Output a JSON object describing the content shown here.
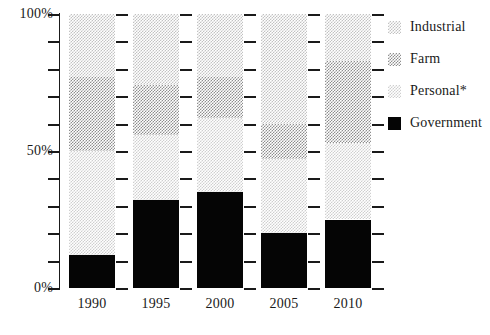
{
  "chart_data": {
    "type": "bar",
    "subtype": "stacked-bar-100-percent",
    "title": "",
    "xlabel": "",
    "ylabel": "",
    "categories": [
      "1990",
      "1995",
      "2000",
      "2005",
      "2010"
    ],
    "ylim": [
      0,
      100
    ],
    "ytick_values": [
      0,
      10,
      20,
      30,
      40,
      50,
      60,
      70,
      80,
      90,
      100
    ],
    "ytick_labels_shown": [
      "0%",
      "50%",
      "100%"
    ],
    "grid": false,
    "legend_position": "right",
    "stack_order_bottom_to_top": [
      "Government",
      "Personal*",
      "Farm",
      "Industrial"
    ],
    "series": [
      {
        "name": "Government",
        "color": "#050505",
        "values": [
          12,
          32,
          35,
          20,
          25
        ]
      },
      {
        "name": "Personal*",
        "color": "#cfcfcf",
        "values": [
          38,
          24,
          27,
          27,
          28
        ]
      },
      {
        "name": "Farm",
        "color": "#8e8e8e",
        "values": [
          27,
          18,
          15,
          13,
          30
        ]
      },
      {
        "name": "Industrial",
        "color": "#c2c2c2",
        "values": [
          23,
          26,
          23,
          40,
          17
        ]
      }
    ]
  },
  "axes": {
    "y_labels": [
      {
        "value": 100,
        "text": "100%"
      },
      {
        "value": 90,
        "text": ""
      },
      {
        "value": 80,
        "text": ""
      },
      {
        "value": 70,
        "text": ""
      },
      {
        "value": 60,
        "text": ""
      },
      {
        "value": 50,
        "text": "50%"
      },
      {
        "value": 40,
        "text": ""
      },
      {
        "value": 30,
        "text": ""
      },
      {
        "value": 20,
        "text": ""
      },
      {
        "value": 10,
        "text": ""
      },
      {
        "value": 0,
        "text": "0%"
      }
    ],
    "x_labels": [
      "1990",
      "1995",
      "2000",
      "2005",
      "2010"
    ]
  },
  "legend": {
    "items": [
      {
        "label": "Industrial",
        "swatch": "industrial-swatch",
        "color": "#c2c2c2"
      },
      {
        "label": "Farm",
        "swatch": "farm-swatch",
        "color": "#8e8e8e"
      },
      {
        "label": "Personal*",
        "swatch": "personal-swatch",
        "color": "#cfcfcf"
      },
      {
        "label": "Government",
        "swatch": "government-swatch",
        "color": "#050505"
      }
    ]
  }
}
